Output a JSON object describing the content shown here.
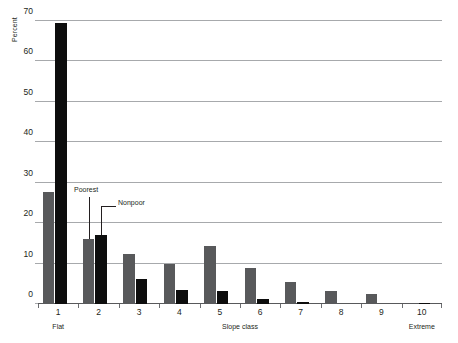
{
  "chart_data": {
    "type": "bar",
    "title": "",
    "subtitle": "",
    "xlabel": "Slope class",
    "ylabel": "Percent",
    "categories": [
      "1",
      "2",
      "3",
      "4",
      "5",
      "6",
      "7",
      "8",
      "9",
      "10"
    ],
    "series": [
      {
        "name": "Poorest",
        "color": "#58595b",
        "values": [
          27.8,
          16.0,
          12.3,
          10.0,
          14.3,
          8.8,
          5.5,
          3.2,
          2.5,
          0.2
        ]
      },
      {
        "name": "Nonpoor",
        "color": "#0d0d0d",
        "values": [
          69.6,
          17.0,
          6.2,
          3.4,
          3.3,
          1.2,
          0.4,
          0.0,
          0.0,
          0.1
        ]
      }
    ],
    "ylim": [
      0,
      70
    ],
    "yticks": [
      0,
      10,
      20,
      30,
      40,
      50,
      60,
      70
    ],
    "ytick_labels": [
      "0",
      "10",
      "20",
      "30",
      "40",
      "50",
      "60",
      "70"
    ],
    "grid": true,
    "legend_position": "inline-annotations",
    "annotations": [
      {
        "text": "Poorest",
        "target_series": "Poorest",
        "target_category": "2"
      },
      {
        "text": "Nonpoor",
        "target_series": "Nonpoor",
        "target_category": "2"
      }
    ],
    "axis_end_labels": {
      "left": "Flat",
      "right": "Extreme"
    }
  },
  "colors": {
    "poorest": "#58595b",
    "nonpoor": "#0d0d0d",
    "gridline": "#a7a9ac",
    "axis": "#58595b",
    "text": "#231f20",
    "background": "#ffffff"
  }
}
